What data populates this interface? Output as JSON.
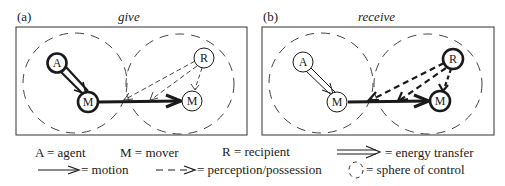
{
  "figure": {
    "panels": [
      {
        "id": "a",
        "tag": "(a)",
        "title": "give",
        "frame": {
          "x": 16,
          "y": 27,
          "w": 231,
          "h": 108
        },
        "spheres": [
          {
            "cx": 75,
            "cy": 83,
            "rx": 52,
            "ry": 50
          },
          {
            "cx": 180,
            "cy": 84,
            "rx": 54,
            "ry": 50
          }
        ],
        "nodes": [
          {
            "id": "A",
            "letter": "A",
            "role": "agent",
            "cx": 57,
            "cy": 63,
            "r": 10,
            "thick": true
          },
          {
            "id": "M1",
            "letter": "M",
            "role": "mover",
            "cx": 88,
            "cy": 102,
            "r": 10,
            "thick": true
          },
          {
            "id": "M2",
            "letter": "M",
            "role": "mover",
            "cx": 192,
            "cy": 101,
            "r": 10,
            "thick": false
          },
          {
            "id": "R",
            "letter": "R",
            "role": "recipient",
            "cx": 204,
            "cy": 58,
            "r": 10,
            "thick": false
          }
        ],
        "emphasis": "agent"
      },
      {
        "id": "b",
        "tag": "(b)",
        "title": "receive",
        "frame": {
          "x": 262,
          "y": 27,
          "w": 232,
          "h": 108
        },
        "spheres": [
          {
            "cx": 321,
            "cy": 83,
            "rx": 52,
            "ry": 50
          },
          {
            "cx": 428,
            "cy": 84,
            "rx": 54,
            "ry": 50
          }
        ],
        "nodes": [
          {
            "id": "A",
            "letter": "A",
            "role": "agent",
            "cx": 303,
            "cy": 62,
            "r": 10,
            "thick": false
          },
          {
            "id": "M1",
            "letter": "M",
            "role": "mover",
            "cx": 337,
            "cy": 102,
            "r": 10,
            "thick": false
          },
          {
            "id": "M2",
            "letter": "M",
            "role": "mover",
            "cx": 440,
            "cy": 101,
            "r": 10,
            "thick": true
          },
          {
            "id": "R",
            "letter": "R",
            "role": "recipient",
            "cx": 453,
            "cy": 59,
            "r": 10,
            "thick": true
          }
        ],
        "emphasis": "recipient"
      }
    ],
    "legend": {
      "row1": [
        {
          "text": "A = agent",
          "x": 35,
          "y": 157
        },
        {
          "text": "M = mover",
          "x": 120,
          "y": 157
        },
        {
          "text": "R = recipient",
          "x": 222,
          "y": 156
        },
        {
          "text": "= energy transfer",
          "x": 385,
          "y": 157,
          "symbol": "energy-transfer-arrow"
        }
      ],
      "row2": [
        {
          "text": "= motion",
          "x": 81,
          "y": 174,
          "symbol": "motion-arrow"
        },
        {
          "text": "= perception/possession",
          "x": 197,
          "y": 174,
          "symbol": "perception-arrow"
        },
        {
          "text": "= sphere of control",
          "x": 366,
          "y": 174,
          "symbol": "sphere-of-control"
        }
      ]
    },
    "colors": {
      "ink": "#1a1a1a",
      "dash": "#333333",
      "background": "#ffffff"
    }
  }
}
